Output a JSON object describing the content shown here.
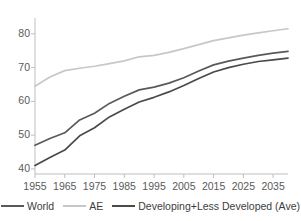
{
  "chart_data": {
    "type": "line",
    "title": "",
    "xlabel": "",
    "ylabel": "",
    "xlim": [
      1955,
      2040
    ],
    "ylim": [
      38.5,
      83.5
    ],
    "grid": false,
    "legend_position": "bottom-center",
    "x_tick_labels": [
      "1955",
      "1965",
      "1975",
      "1985",
      "1995",
      "2005",
      "2015",
      "2025",
      "2035"
    ],
    "x_ticks": [
      1955,
      1965,
      1975,
      1985,
      1995,
      2005,
      2015,
      2025,
      2035
    ],
    "y_tick_labels": [
      "40",
      "50",
      "60",
      "70",
      "80"
    ],
    "y_ticks": [
      40,
      50,
      60,
      70,
      80
    ],
    "x": [
      1955,
      1960,
      1965,
      1970,
      1975,
      1980,
      1985,
      1990,
      1995,
      2000,
      2005,
      2010,
      2015,
      2020,
      2025,
      2030,
      2035,
      2040
    ],
    "series": [
      {
        "name": "World",
        "color": "#595959",
        "values": [
          47.0,
          49.0,
          50.7,
          54.5,
          56.5,
          59.4,
          61.5,
          63.4,
          64.2,
          65.4,
          67.0,
          69.0,
          70.8,
          71.9,
          72.8,
          73.6,
          74.3,
          74.8
        ]
      },
      {
        "name": "AE",
        "color": "#c7c7c7",
        "values": [
          64.5,
          67.2,
          69.1,
          69.8,
          70.4,
          71.2,
          72.0,
          73.2,
          73.6,
          74.5,
          75.6,
          76.8,
          78.0,
          78.8,
          79.6,
          80.3,
          80.9,
          81.5
        ]
      },
      {
        "name": "Developing+Less Developed (Ave)",
        "color": "#4a4a4a",
        "values": [
          41.0,
          43.4,
          45.6,
          49.8,
          52.2,
          55.4,
          57.7,
          59.8,
          61.2,
          62.8,
          64.7,
          66.8,
          68.7,
          70.0,
          71.0,
          71.8,
          72.3,
          72.8
        ]
      }
    ],
    "axis_color": "#bfbfbf",
    "tick_label_color": "#5a5a5a"
  },
  "legend": {
    "items": [
      {
        "label": "World"
      },
      {
        "label": "AE"
      },
      {
        "label": "Developing+Less Developed (Ave)"
      }
    ]
  }
}
